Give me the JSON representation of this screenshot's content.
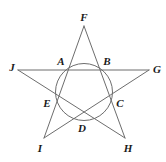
{
  "figure": {
    "name": "pentagram-with-inscribed-circle",
    "background_color": "#ffffff",
    "stroke_color": "#6d6d6d",
    "label_color": "#1a1a1a",
    "width": 166,
    "height": 162
  },
  "circle": {
    "cx": 84,
    "cy": 92,
    "r": 28.5
  },
  "points": {
    "A": {
      "label": "A",
      "x": 64,
      "y": 70,
      "label_x": 61,
      "label_y": 61,
      "role": "intersection"
    },
    "B": {
      "label": "B",
      "x": 104,
      "y": 70,
      "label_x": 107,
      "label_y": 61,
      "role": "intersection"
    },
    "C": {
      "label": "C",
      "x": 110,
      "y": 101,
      "label_x": 120,
      "label_y": 103,
      "role": "intersection"
    },
    "D": {
      "label": "D",
      "x": 84,
      "y": 120,
      "label_x": 82,
      "label_y": 128,
      "role": "intersection"
    },
    "E": {
      "label": "E",
      "x": 58,
      "y": 101,
      "label_x": 47,
      "label_y": 103,
      "role": "intersection"
    },
    "F": {
      "label": "F",
      "x": 84,
      "y": 26,
      "label_x": 84,
      "label_y": 17,
      "role": "star-tip"
    },
    "G": {
      "label": "G",
      "x": 149,
      "y": 70,
      "label_x": 157,
      "label_y": 69,
      "role": "star-tip"
    },
    "H": {
      "label": "H",
      "x": 125,
      "y": 138,
      "label_x": 128,
      "label_y": 148,
      "role": "star-tip"
    },
    "I": {
      "label": "I",
      "x": 44,
      "y": 138,
      "label_x": 40,
      "label_y": 148,
      "role": "star-tip"
    },
    "J": {
      "label": "J",
      "x": 18,
      "y": 70,
      "label_x": 12,
      "label_y": 67,
      "role": "star-tip"
    }
  },
  "edges": [
    {
      "name": "F-to-C",
      "from": "F",
      "to": "H"
    },
    {
      "name": "F-to-E",
      "from": "F",
      "to": "I"
    },
    {
      "name": "J-to-G",
      "from": "J",
      "to": "G"
    },
    {
      "name": "J-to-H",
      "from": "J",
      "to": "H"
    },
    {
      "name": "G-to-I",
      "from": "G",
      "to": "I"
    }
  ],
  "paths": {
    "line_F_H": "M 84 26 L 125 138",
    "line_F_I": "M 84 26 L 44 138",
    "line_J_G": "M 18 70 L 149 70",
    "line_J_H": "M 18 70 L 125 138",
    "line_G_I": "M 149 70 L 44 138"
  }
}
